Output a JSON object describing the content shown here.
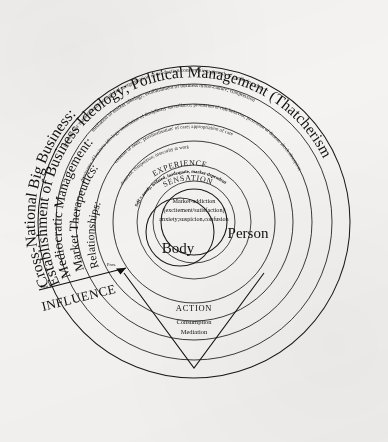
{
  "figure": {
    "background_color": "#f4f3f2",
    "ink_color": "#141414"
  },
  "axis": {
    "name": "INFLUENCE",
    "label": "INFLUENCE",
    "distal_label": "Dist.",
    "proximal_label": "Prox."
  },
  "rings": [
    {
      "id": "ring-1",
      "heading": "Cross-National Big Business:",
      "detail": "pressure for market expansion; global reorganization of production/consumption; growth of mediating class"
    },
    {
      "id": "ring-2",
      "heading": "Establishment of Business Ideology; Political Management (Thatcherism)",
      "detail": "mediation of market ideology; establishment of business mono-culture; compression"
    },
    {
      "id": "ring-3",
      "heading": "Mediocratic Management:",
      "detail": "dominance of business ideology; installation of disciplinary surveillance; promotion of risk-behavior; promotion of dissent; shock absorption"
    },
    {
      "id": "ring-4",
      "heading": "Market Therapeutics:",
      "detail": "creation of need; 'proximalisation' of care; appropriation of care"
    },
    {
      "id": "ring-5",
      "heading": "Relationships:",
      "detail": "domestic competition; insecurity at work"
    }
  ],
  "inner_bands": [
    {
      "id": "band-experience",
      "label": "EXPERIENCE"
    },
    {
      "id": "band-self",
      "label": "Self = needy, isolated, inadequate, market-dependent"
    },
    {
      "id": "band-sensation",
      "label": "SENSATION"
    }
  ],
  "core": {
    "lines": [
      "Market-addiction",
      "(excitement/satisfaction)",
      "anxiety;suspicion,confusion"
    ],
    "person_label": "Person",
    "body_label": "Body"
  },
  "action": {
    "label": "ACTION",
    "lines": [
      "Consumption",
      "Mediation"
    ]
  }
}
